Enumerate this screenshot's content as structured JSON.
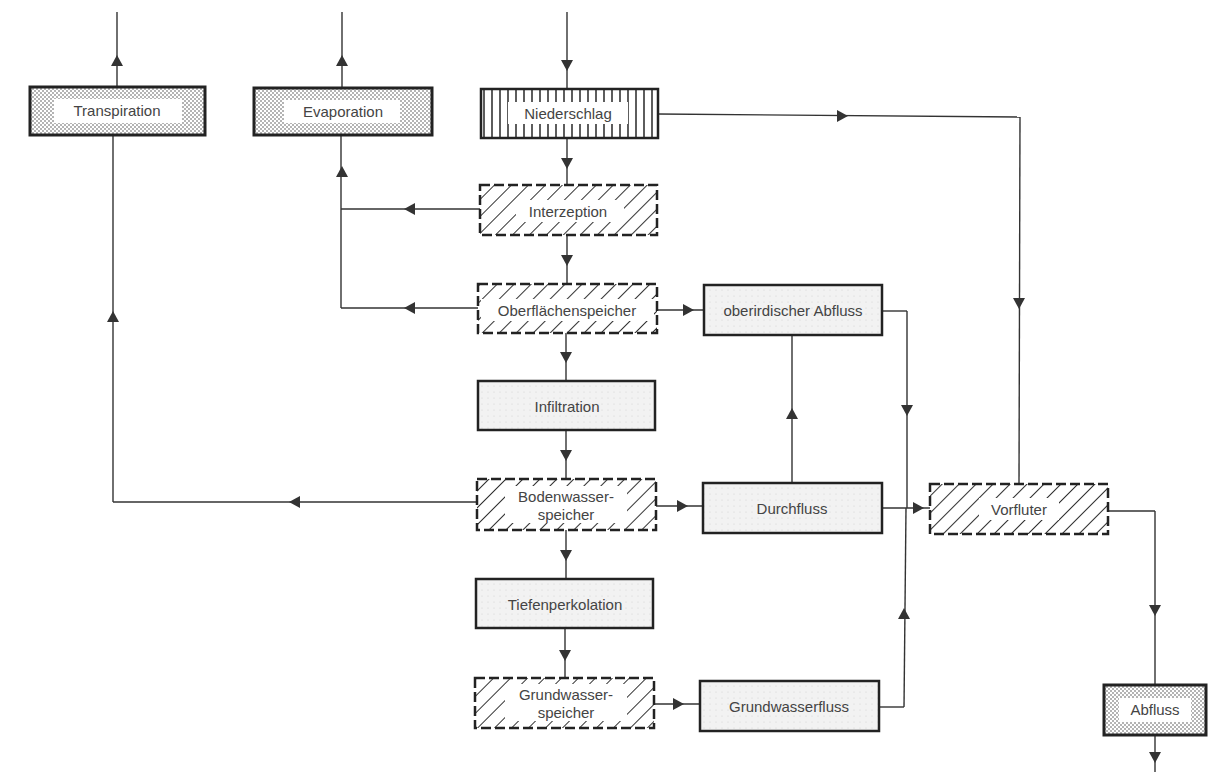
{
  "nodes": {
    "transpiration": {
      "label": "Transpiration",
      "style": "stipple"
    },
    "evaporation": {
      "label": "Evaporation",
      "style": "stipple"
    },
    "niederschlag": {
      "label": "Niederschlag",
      "style": "vertical"
    },
    "interzeption": {
      "label": "Interzeption",
      "style": "hatched-dashed"
    },
    "oberflaechenspeicher": {
      "label": "Oberflächenspeicher",
      "style": "hatched-dashed"
    },
    "oberirdischer_abfluss": {
      "label": "oberirdischer Abfluss",
      "style": "light"
    },
    "infiltration": {
      "label": "Infiltration",
      "style": "light"
    },
    "bodenwasserspeicher": {
      "label_line1": "Bodenwasser-",
      "label_line2": "speicher",
      "style": "hatched-dashed"
    },
    "durchfluss": {
      "label": "Durchfluss",
      "style": "light"
    },
    "vorfluter": {
      "label": "Vorfluter",
      "style": "hatched-dashed"
    },
    "tiefenperkolation": {
      "label": "Tiefenperkolation",
      "style": "light"
    },
    "grundwasserspeicher": {
      "label_line1": "Grundwasser-",
      "label_line2": "speicher",
      "style": "hatched-dashed"
    },
    "grundwasserfluss": {
      "label": "Grundwasserfluss",
      "style": "light"
    },
    "abfluss": {
      "label": "Abfluss",
      "style": "stipple"
    }
  },
  "edges": [
    [
      "input",
      "niederschlag"
    ],
    [
      "niederschlag",
      "interzeption"
    ],
    [
      "niederschlag",
      "vorfluter"
    ],
    [
      "interzeption",
      "evaporation"
    ],
    [
      "interzeption",
      "oberflaechenspeicher"
    ],
    [
      "oberflaechenspeicher",
      "evaporation"
    ],
    [
      "oberflaechenspeicher",
      "oberirdischer_abfluss"
    ],
    [
      "oberflaechenspeicher",
      "infiltration"
    ],
    [
      "oberirdischer_abfluss",
      "vorfluter"
    ],
    [
      "infiltration",
      "bodenwasserspeicher"
    ],
    [
      "bodenwasserspeicher",
      "transpiration"
    ],
    [
      "bodenwasserspeicher",
      "durchfluss"
    ],
    [
      "bodenwasserspeicher",
      "tiefenperkolation"
    ],
    [
      "durchfluss",
      "oberirdischer_abfluss"
    ],
    [
      "durchfluss",
      "vorfluter"
    ],
    [
      "tiefenperkolation",
      "grundwasserspeicher"
    ],
    [
      "grundwasserspeicher",
      "grundwasserfluss"
    ],
    [
      "grundwasserfluss",
      "vorfluter"
    ],
    [
      "vorfluter",
      "abfluss"
    ],
    [
      "transpiration",
      "output"
    ],
    [
      "evaporation",
      "output"
    ],
    [
      "abfluss",
      "output"
    ]
  ],
  "colors": {
    "line": "#333333",
    "text": "#444444",
    "border": "#222222",
    "fill_light": "#eeeeee"
  }
}
